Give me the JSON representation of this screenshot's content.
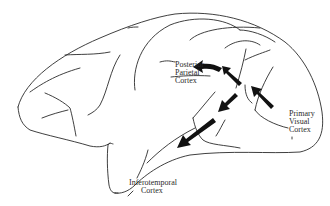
{
  "diagram": {
    "labels": {
      "posterior_parietal": [
        "Posterior",
        "Parietal",
        "Cortex"
      ],
      "primary_visual": [
        "Primary",
        "Visual",
        "Cortex"
      ],
      "inferotemporal": [
        "Inferotemporal",
        "Cortex"
      ]
    },
    "arrows": [
      {
        "name": "dorsal-stream-arrow-1",
        "from": "Primary Visual Cortex",
        "direction": "up-left"
      },
      {
        "name": "dorsal-stream-arrow-2",
        "direction": "up-left"
      },
      {
        "name": "dorsal-stream-arrow-3",
        "to": "Posterior Parietal Cortex",
        "direction": "left"
      },
      {
        "name": "ventral-stream-arrow-1",
        "direction": "down-left"
      },
      {
        "name": "ventral-stream-arrow-2",
        "to": "Inferotemporal Cortex",
        "direction": "down-left"
      }
    ],
    "colors": {
      "line": "#2a2a2a",
      "arrow": "#111111",
      "background": "#ffffff"
    }
  }
}
